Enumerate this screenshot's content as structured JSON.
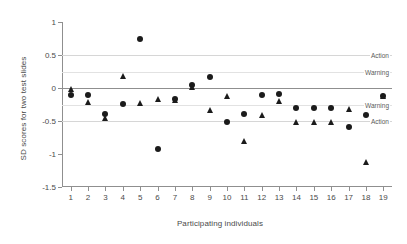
{
  "chart_data": {
    "type": "scatter",
    "title": "",
    "xlabel": "Participating individuals",
    "ylabel": "SD scores for two test slides",
    "xlim": [
      0.5,
      19.5
    ],
    "ylim": [
      -1.5,
      1.0
    ],
    "grid": false,
    "legend_position": "none",
    "x_tick_labels": [
      "1",
      "2",
      "3",
      "4",
      "5",
      "6",
      "7",
      "8",
      "9",
      "10",
      "11",
      "12",
      "13",
      "14",
      "15",
      "16",
      "17",
      "18",
      "19"
    ],
    "y_tick_labels": [
      "1",
      "0.5",
      "0",
      "-0.5",
      "-1",
      "-1.5"
    ],
    "y_tick_values": [
      1,
      0.5,
      0,
      -0.5,
      -1,
      -1.5
    ],
    "categories": [
      1,
      2,
      3,
      4,
      5,
      6,
      7,
      8,
      9,
      10,
      11,
      12,
      13,
      14,
      15,
      16,
      17,
      18,
      19
    ],
    "series": [
      {
        "name": "Test slide 1",
        "marker": "circle",
        "color": "#1b1b1b",
        "values": [
          -0.1,
          -0.1,
          -0.4,
          -0.24,
          0.75,
          -0.92,
          -0.16,
          0.05,
          0.16,
          -0.51,
          -0.4,
          -0.1,
          -0.09,
          -0.31,
          -0.31,
          -0.3,
          -0.59,
          -0.41,
          -0.12
        ]
      },
      {
        "name": "Test slide 2",
        "marker": "triangle",
        "color": "#1b1b1b",
        "values": [
          -0.01,
          -0.21,
          -0.45,
          0.18,
          -0.23,
          -0.16,
          -0.18,
          0.01,
          -0.34,
          -0.12,
          -0.8,
          -0.41,
          -0.2,
          -0.51,
          -0.51,
          -0.51,
          -0.32,
          -1.12,
          -0.12
        ]
      }
    ],
    "reference_lines": [
      {
        "id": "action-upper",
        "value": 0.5,
        "label": "Action",
        "color": "#d6d6d6",
        "style": "action"
      },
      {
        "id": "warning-upper",
        "value": 0.25,
        "label": "Warning",
        "color": "#e2e2e2",
        "style": "warn"
      },
      {
        "id": "zero",
        "value": 0.0,
        "label": "",
        "color": "#8f8f8f",
        "style": "zero"
      },
      {
        "id": "warning-lower",
        "value": -0.25,
        "label": "Warning",
        "color": "#e2e2e2",
        "style": "warn"
      },
      {
        "id": "action-lower",
        "value": -0.5,
        "label": "Action",
        "color": "#d6d6d6",
        "style": "action"
      }
    ]
  }
}
